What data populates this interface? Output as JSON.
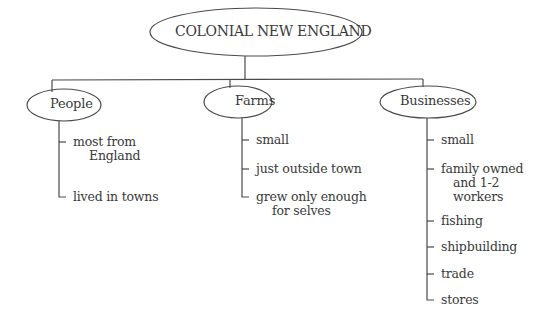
{
  "diagram": {
    "root": {
      "label": "COLONIAL NEW ENGLAND"
    },
    "branches": [
      {
        "label": "People",
        "items": [
          {
            "line1": "most from",
            "line2": "England"
          },
          {
            "line1": "lived in towns"
          }
        ]
      },
      {
        "label": "Farms",
        "items": [
          {
            "line1": "small"
          },
          {
            "line1": "just outside town"
          },
          {
            "line1": "grew only enough",
            "line2": "for selves"
          }
        ]
      },
      {
        "label": "Businesses",
        "items": [
          {
            "line1": "small"
          },
          {
            "line1": "family owned",
            "line2": "and 1-2",
            "line3": "workers"
          },
          {
            "line1": "fishing"
          },
          {
            "line1": "shipbuilding"
          },
          {
            "line1": "trade"
          },
          {
            "line1": "stores"
          }
        ]
      }
    ],
    "colors": {
      "line": "#4a4a4a",
      "text": "#3a3a3a",
      "background": "#ffffff"
    }
  }
}
